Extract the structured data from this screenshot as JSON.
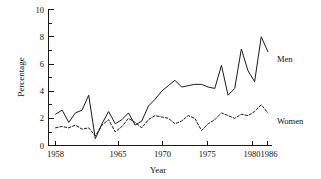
{
  "chart_data": {
    "type": "line",
    "title": "",
    "xlabel": "Year",
    "ylabel": "Percentage",
    "xlim": [
      1958,
      1986
    ],
    "ylim": [
      0,
      10
    ],
    "xticks": [
      1958,
      1965,
      1970,
      1975,
      1980,
      1986
    ],
    "xtick_labels": [
      "1958",
      "1965",
      "1970",
      "1975",
      "1980",
      "1986"
    ],
    "yticks": [
      0,
      2,
      4,
      6,
      8,
      10
    ],
    "ytick_labels": [
      "0",
      "2",
      "4",
      "6",
      "8",
      "10"
    ],
    "grid": false,
    "legend_position": "inline-right",
    "x": [
      1958,
      1959,
      1960,
      1961,
      1962,
      1963,
      1964,
      1965,
      1966,
      1967,
      1968,
      1969,
      1970,
      1971,
      1972,
      1973,
      1974,
      1975,
      1976,
      1977,
      1978,
      1979,
      1980,
      1981,
      1982,
      1983,
      1984,
      1985,
      1986
    ],
    "series": [
      {
        "name": "Men",
        "style": "solid",
        "label": "Men",
        "values": [
          2.3,
          2.6,
          1.7,
          2.4,
          2.6,
          3.7,
          0.5,
          1.6,
          2.5,
          1.6,
          1.9,
          2.4,
          1.5,
          1.8,
          2.9,
          3.4,
          4.0,
          4.4,
          4.8,
          4.3,
          4.4,
          4.5,
          4.5,
          4.3,
          4.2,
          4.4,
          5.9,
          4.4,
          3.7
        ]
      },
      {
        "name": "Women",
        "style": "dashed",
        "label": "Women",
        "values": [
          1.3,
          1.4,
          1.3,
          1.5,
          1.2,
          1.3,
          0.7,
          1.5,
          1.9,
          1.0,
          1.4,
          2.0,
          1.7,
          1.3,
          1.9,
          2.2,
          2.1,
          2.0,
          1.6,
          1.8,
          2.2,
          2.0,
          2.2,
          2.5,
          2.1,
          1.4,
          1.1,
          1.5,
          1.8
        ]
      }
    ]
  },
  "axis": {
    "ylabel": "Percentage",
    "xlabel": "Year"
  },
  "labels": {
    "men": "Men",
    "women": "Women"
  }
}
